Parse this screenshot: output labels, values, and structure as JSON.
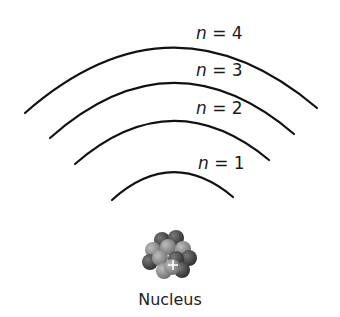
{
  "diagram": {
    "levels": [
      {
        "var": "n",
        "eq": "=",
        "value": "4"
      },
      {
        "var": "n",
        "eq": "=",
        "value": "3"
      },
      {
        "var": "n",
        "eq": "=",
        "value": "2"
      },
      {
        "var": "n",
        "eq": "=",
        "value": "1"
      }
    ],
    "nucleus": {
      "label": "Nucleus",
      "charge_symbol": "+"
    },
    "colors": {
      "arc": "#111111",
      "text": "#1a1a1a",
      "proton": "#8a8a8a",
      "neutron": "#4a4a4a"
    }
  }
}
